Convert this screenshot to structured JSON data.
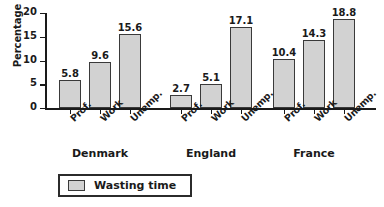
{
  "chart_data": {
    "type": "bar",
    "title": "",
    "xlabel": "",
    "ylabel": "Percentage",
    "ylim": [
      0,
      20
    ],
    "yticks": [
      0,
      5,
      10,
      15,
      20
    ],
    "grid": false,
    "legend_position": "bottom-left",
    "groups": [
      {
        "name": "Denmark",
        "categories": [
          "Prof.",
          "Work",
          "Unemp."
        ],
        "values": [
          5.8,
          9.6,
          15.6
        ],
        "labels": [
          "5.8",
          "9.6",
          "15.6"
        ]
      },
      {
        "name": "England",
        "categories": [
          "Prof.",
          "Work",
          "Unemp."
        ],
        "values": [
          2.7,
          5.1,
          17.1
        ],
        "labels": [
          "2.7",
          "5.1",
          "17.1"
        ]
      },
      {
        "name": "France",
        "categories": [
          "Prof.",
          "Work",
          "Unemp."
        ],
        "values": [
          10.4,
          14.3,
          18.8
        ],
        "labels": [
          "10.4",
          "14.3",
          "18.8"
        ]
      }
    ],
    "series": [
      {
        "name": "Wasting time",
        "color": "#d2d2d2",
        "edge_color": "#3a3a3a",
        "values": [
          5.8,
          9.6,
          15.6,
          2.7,
          5.1,
          17.1,
          10.4,
          14.3,
          18.8
        ]
      }
    ],
    "legend": [
      {
        "label": "Wasting time",
        "color": "#d2d2d2"
      }
    ]
  },
  "axis": {
    "tick_labels": [
      "0",
      "5",
      "10",
      "15",
      "20"
    ]
  }
}
